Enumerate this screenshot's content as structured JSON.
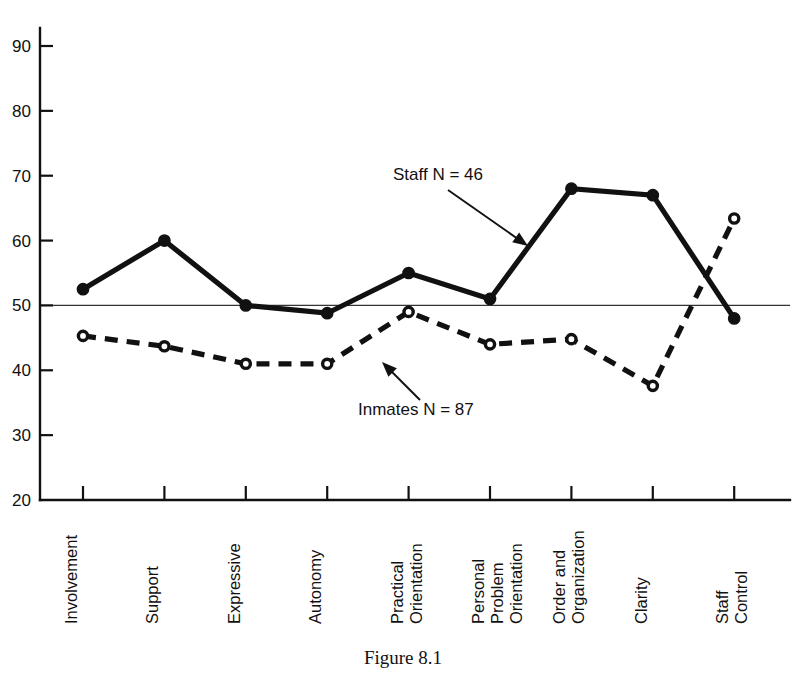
{
  "figure": {
    "caption": "Figure 8.1"
  },
  "chart_data": {
    "type": "line",
    "title": "",
    "xlabel": "",
    "ylabel": "",
    "ylim": [
      20,
      90
    ],
    "yticks": [
      20,
      30,
      40,
      50,
      60,
      70,
      80,
      90
    ],
    "ytick_labels": [
      "20",
      "30",
      "40",
      "50",
      "60",
      "70",
      "80",
      "90"
    ],
    "grid": false,
    "reference_line": 50,
    "legend_position": "inline-annotations",
    "categories": [
      "Involvement",
      "Support",
      "Expressive",
      "Autonomy",
      "Practical Orientation",
      "Personal Problem Orientation",
      "Order and Organization",
      "Clarity",
      "Staff Control"
    ],
    "category_label_lines": [
      [
        "Involvement"
      ],
      [
        "Support"
      ],
      [
        "Expressive"
      ],
      [
        "Autonomy"
      ],
      [
        "Practical",
        "Orientation"
      ],
      [
        "Personal",
        "Problem",
        "Orientation"
      ],
      [
        "Order and",
        "Organization"
      ],
      [
        "Clarity"
      ],
      [
        "Staff",
        "Control"
      ]
    ],
    "series": [
      {
        "name": "Staff",
        "n": 46,
        "label": "Staff  N = 46",
        "style": "solid",
        "marker": "filled-circle",
        "values": [
          52.5,
          60,
          50,
          48.8,
          55,
          51,
          68,
          67,
          48
        ]
      },
      {
        "name": "Inmates",
        "n": 87,
        "label": "Inmates N = 87",
        "style": "dashed",
        "marker": "open-circle",
        "values": [
          45.3,
          43.7,
          41,
          41,
          49,
          44,
          44.8,
          37.6,
          63.4
        ]
      }
    ],
    "annotations": [
      {
        "text": "Staff  N = 46",
        "series": "Staff",
        "points_to_category": "Personal Problem Orientation"
      },
      {
        "text": "Inmates N = 87",
        "series": "Inmates",
        "points_to_category": "Practical Orientation"
      }
    ]
  }
}
